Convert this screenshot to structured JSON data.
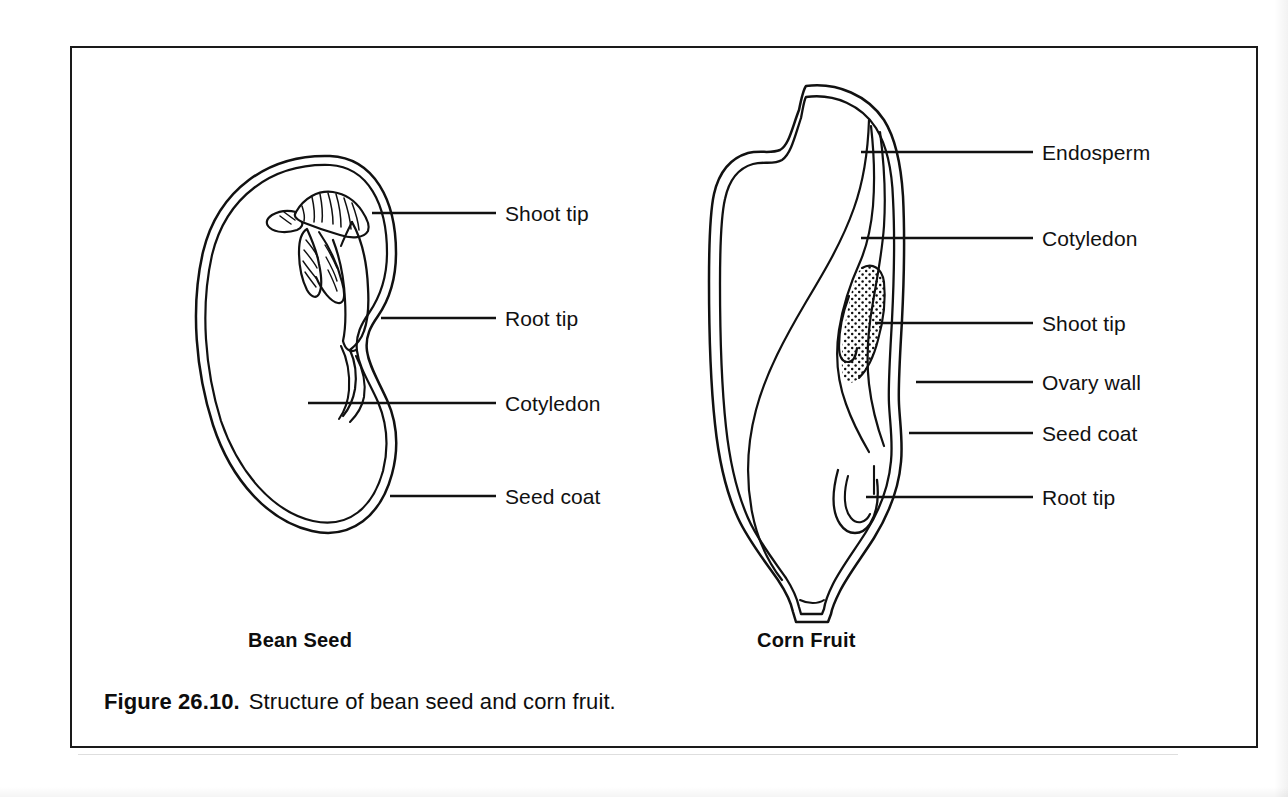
{
  "figure": {
    "caption_number": "Figure 26.10.",
    "caption_text": "Structure of bean seed and corn fruit."
  },
  "specimens": [
    {
      "id": "bean-seed",
      "title": "Bean Seed",
      "title_x": 248,
      "title_y": 629,
      "labels": [
        {
          "id": "shoot-tip",
          "text": "Shoot tip",
          "text_x": 505,
          "text_y": 203,
          "leader_x1": 372,
          "leader_x2": 496,
          "leader_y": 213
        },
        {
          "id": "root-tip",
          "text": "Root tip",
          "text_x": 505,
          "text_y": 308,
          "leader_x1": 381,
          "leader_x2": 496,
          "leader_y": 318
        },
        {
          "id": "cotyledon",
          "text": "Cotyledon",
          "text_x": 505,
          "text_y": 393,
          "leader_x1": 308,
          "leader_x2": 496,
          "leader_y": 403
        },
        {
          "id": "seed-coat",
          "text": "Seed coat",
          "text_x": 505,
          "text_y": 486,
          "leader_x1": 390,
          "leader_x2": 496,
          "leader_y": 496
        }
      ]
    },
    {
      "id": "corn-fruit",
      "title": "Corn Fruit",
      "title_x": 757,
      "title_y": 629,
      "labels": [
        {
          "id": "endosperm",
          "text": "Endosperm",
          "text_x": 1042,
          "text_y": 142,
          "leader_x1": 861,
          "leader_x2": 1033,
          "leader_y": 152
        },
        {
          "id": "cotyledon",
          "text": "Cotyledon",
          "text_x": 1042,
          "text_y": 228,
          "leader_x1": 861,
          "leader_x2": 1033,
          "leader_y": 238
        },
        {
          "id": "shoot-tip",
          "text": "Shoot tip",
          "text_x": 1042,
          "text_y": 313,
          "leader_x1": 875,
          "leader_x2": 1033,
          "leader_y": 323
        },
        {
          "id": "ovary-wall",
          "text": "Ovary wall",
          "text_x": 1042,
          "text_y": 372,
          "leader_x1": 916,
          "leader_x2": 1033,
          "leader_y": 382
        },
        {
          "id": "seed-coat",
          "text": "Seed coat",
          "text_x": 1042,
          "text_y": 423,
          "leader_x1": 909,
          "leader_x2": 1033,
          "leader_y": 433
        },
        {
          "id": "root-tip",
          "text": "Root tip",
          "text_x": 1042,
          "text_y": 487,
          "leader_x1": 866,
          "leader_x2": 1033,
          "leader_y": 497
        }
      ]
    }
  ],
  "style": {
    "ink": "#111111",
    "paper": "#ffffff",
    "frame": "#1a1a1a"
  }
}
